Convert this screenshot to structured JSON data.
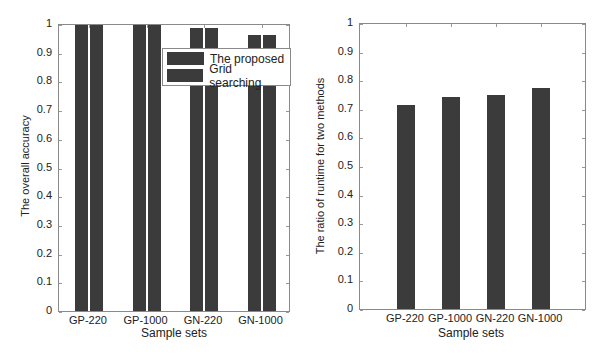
{
  "chart_data": [
    {
      "type": "bar",
      "title": "",
      "xlabel": "Sample sets",
      "ylabel": "The overall accuracy",
      "categories": [
        "GP-220",
        "GP-1000",
        "GN-220",
        "GN-1000"
      ],
      "series": [
        {
          "name": "The proposed",
          "values": [
            0.997,
            0.997,
            0.985,
            0.963
          ]
        },
        {
          "name": "Grid searching",
          "values": [
            0.997,
            0.997,
            0.985,
            0.963
          ]
        }
      ],
      "ylim": [
        0,
        1
      ],
      "yticks": [
        "0",
        "0.1",
        "0.2",
        "0.3",
        "0.4",
        "0.5",
        "0.6",
        "0.7",
        "0.8",
        "0.9",
        "1"
      ],
      "legend_position": "upper right",
      "grid": false,
      "bar_color": "#3b3b3b"
    },
    {
      "type": "bar",
      "title": "",
      "xlabel": "Sample sets",
      "ylabel": "The ratio of runtime for two methods",
      "categories": [
        "GP-220",
        "GP-1000",
        "GN-220",
        "GN-1000"
      ],
      "values": [
        0.712,
        0.74,
        0.747,
        0.772
      ],
      "ylim": [
        0,
        1
      ],
      "yticks": [
        "0",
        "0.1",
        "0.2",
        "0.3",
        "0.4",
        "0.5",
        "0.6",
        "0.7",
        "0.8",
        "0.9",
        "1"
      ],
      "grid": false,
      "bar_color": "#3b3b3b"
    }
  ],
  "left": {
    "ylabel": "The overall accuracy",
    "xlabel": "Sample sets",
    "legend": [
      "The proposed",
      "Grid searching"
    ]
  },
  "right": {
    "ylabel": "The ratio of runtime for two methods",
    "xlabel": "Sample sets"
  }
}
